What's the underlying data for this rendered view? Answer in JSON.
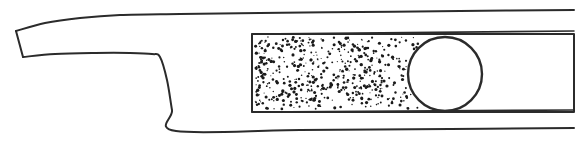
{
  "figure": {
    "title": "Tapered blade profile with stippled section and circular bore",
    "type": "technical-line-drawing",
    "width": 588,
    "height": 151,
    "background_color": "#ffffff",
    "line_color": "#2b2b2b",
    "stipple_color": "#1a1a1a",
    "fill_color": "#ffffff",
    "line_width": 2.0,
    "thin_line_width": 1.6
  },
  "geometry": {
    "tip": {
      "name": "blunt-angled-nose",
      "top_point": [
        16,
        31
      ],
      "bottom_point": [
        23,
        57
      ]
    },
    "upper_contour": {
      "name": "top-edge",
      "description": "Gently curving upper edge rising from the nose then running nearly straight to the right margin",
      "points": [
        [
          16,
          31
        ],
        [
          45,
          23
        ],
        [
          80,
          18
        ],
        [
          120,
          15
        ],
        [
          180,
          14
        ],
        [
          260,
          13
        ],
        [
          360,
          12
        ],
        [
          460,
          11
        ],
        [
          574,
          10
        ]
      ]
    },
    "second_contour": {
      "name": "inner-upper-edge",
      "description": "Lower edge of the tapered nose, dipping slightly then rising to a rounded shoulder",
      "points": [
        [
          23,
          57
        ],
        [
          55,
          54
        ],
        [
          95,
          53
        ],
        [
          130,
          53
        ],
        [
          152,
          54
        ],
        [
          160,
          57
        ],
        [
          167,
          80
        ],
        [
          172,
          110
        ],
        [
          176,
          131
        ]
      ]
    },
    "shoulder": {
      "name": "shoulder-corner",
      "position": [
        159,
        55
      ],
      "radius": 6
    },
    "diagonal": {
      "name": "step-diagonal",
      "from": [
        160,
        57
      ],
      "to": [
        176,
        131
      ]
    },
    "lower_contour": {
      "name": "bottom-edge",
      "description": "Flat bottom line running from the base of the diagonal to the right margin",
      "points": [
        [
          176,
          131
        ],
        [
          300,
          130
        ],
        [
          450,
          129
        ],
        [
          574,
          128
        ]
      ]
    },
    "upper_right_line": {
      "name": "upper-inner-line",
      "description": "Inner horizontal line across the right portion, above the stippled rectangle",
      "from": [
        252,
        34
      ],
      "to": [
        574,
        31
      ]
    },
    "lower_right_line": {
      "name": "lower-inner-line",
      "description": "Inner horizontal line across the right portion, below the stippled rectangle",
      "from": [
        252,
        112
      ],
      "to": [
        574,
        110
      ]
    },
    "stipple_rectangle": {
      "name": "stippled-section",
      "x": 252,
      "y": 34,
      "width": 322,
      "height": 78,
      "left_edge_closed": true,
      "right_edge_open": true,
      "fill_extent_x": 412,
      "description": "Rectangular section filled with random stipple dots representing a granular or sand-cast material; fill stops at the circular bore"
    },
    "bore_circle": {
      "name": "circular-bore",
      "center_x": 445,
      "center_y": 74,
      "radius": 37,
      "description": "Open circular bore or hole interrupting the stippled section"
    }
  },
  "stipple": {
    "dot_count": 520,
    "min_radius": 0.5,
    "max_radius": 1.7,
    "seed": 20147,
    "region": {
      "x": 255,
      "y": 37,
      "width": 155,
      "height": 72
    },
    "description": "Pseudo-random stipple texture denoting a sectioned granular material"
  }
}
